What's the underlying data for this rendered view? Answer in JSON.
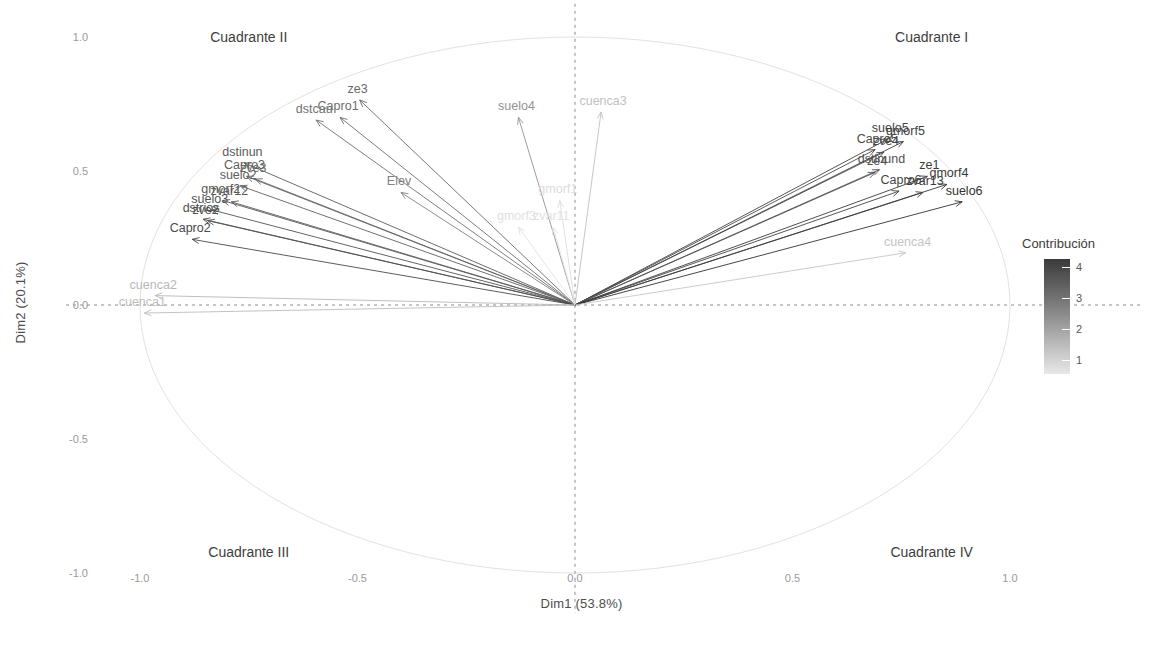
{
  "chart_data": {
    "type": "scatter",
    "subtype": "pca-variable-correlation-biplot",
    "title": "",
    "xlabel": "Dim1 (53.8%)",
    "ylabel": "Dim2 (20.1%)",
    "xlim": [
      -1.15,
      1.15
    ],
    "ylim": [
      -1.15,
      1.15
    ],
    "xticks": [
      "-1.0",
      "-0.5",
      "0.0",
      "0.5",
      "1.0"
    ],
    "xtick_values": [
      -1.0,
      -0.5,
      0.0,
      0.5,
      1.0
    ],
    "yticks": [
      "-1.0",
      "-0.5",
      "0.0",
      "0.5",
      "1.0"
    ],
    "ytick_values": [
      -1.0,
      -0.5,
      0.0,
      0.5,
      1.0
    ],
    "grid": false,
    "reference_circle": true,
    "reference_lines": [
      "x=0 dashed",
      "y=0 dashed"
    ],
    "legend": {
      "title": "Contribución",
      "position": "right",
      "type": "continuous-colorbar",
      "ticks": [
        "4",
        "3",
        "2",
        "1"
      ],
      "tick_values": [
        4,
        3,
        2,
        1
      ],
      "low_color": "#e8e8e8",
      "high_color": "#3a3a3a"
    },
    "annotations": [
      {
        "text": "Cuadrante I",
        "x": 0.82,
        "y": 1.0
      },
      {
        "text": "Cuadrante II",
        "x": -0.75,
        "y": 1.0
      },
      {
        "text": "Cuadrante III",
        "x": -0.75,
        "y": -0.92
      },
      {
        "text": "Cuadrante IV",
        "x": 0.82,
        "y": -0.92
      }
    ],
    "variables": [
      {
        "label": "ze3",
        "x": -0.495,
        "y": 0.765,
        "contrib": 3.1
      },
      {
        "label": "Capro1",
        "x": -0.54,
        "y": 0.7,
        "contrib": 3.0
      },
      {
        "label": "dstcau",
        "x": -0.595,
        "y": 0.69,
        "contrib": 2.9
      },
      {
        "label": "dstinun",
        "x": -0.76,
        "y": 0.53,
        "contrib": 3.4
      },
      {
        "label": "Capro3",
        "x": -0.755,
        "y": 0.48,
        "contrib": 3.3
      },
      {
        "label": "zve3",
        "x": -0.735,
        "y": 0.47,
        "contrib": 3.2
      },
      {
        "label": "suelo2",
        "x": -0.77,
        "y": 0.445,
        "contrib": 3.3
      },
      {
        "label": "gmorf2",
        "x": -0.81,
        "y": 0.39,
        "contrib": 3.5
      },
      {
        "label": "zvar12",
        "x": -0.79,
        "y": 0.385,
        "contrib": 3.4
      },
      {
        "label": "suelo3",
        "x": -0.835,
        "y": 0.355,
        "contrib": 3.6
      },
      {
        "label": "dstrios",
        "x": -0.855,
        "y": 0.32,
        "contrib": 3.7
      },
      {
        "label": "zve2",
        "x": -0.845,
        "y": 0.315,
        "contrib": 3.6
      },
      {
        "label": "Capro2",
        "x": -0.88,
        "y": 0.245,
        "contrib": 3.8
      },
      {
        "label": "cuenca2",
        "x": -0.965,
        "y": 0.035,
        "contrib": 1.4
      },
      {
        "label": "cuenca1",
        "x": -0.99,
        "y": -0.03,
        "contrib": 1.3
      },
      {
        "label": "Elev",
        "x": -0.4,
        "y": 0.42,
        "contrib": 2.6
      },
      {
        "label": "suelo4",
        "x": -0.13,
        "y": 0.7,
        "contrib": 2.2
      },
      {
        "label": "cuenca3",
        "x": 0.06,
        "y": 0.72,
        "contrib": 1.2
      },
      {
        "label": "gmorf1",
        "x": -0.035,
        "y": 0.39,
        "contrib": 0.6
      },
      {
        "label": "gmorf3",
        "x": -0.13,
        "y": 0.29,
        "contrib": 0.5
      },
      {
        "label": "zvar11",
        "x": -0.05,
        "y": 0.29,
        "contrib": 0.5
      },
      {
        "label": "suelo5",
        "x": 0.72,
        "y": 0.62,
        "contrib": 3.9
      },
      {
        "label": "gmorf5",
        "x": 0.755,
        "y": 0.61,
        "contrib": 4.0
      },
      {
        "label": "Capro5",
        "x": 0.69,
        "y": 0.58,
        "contrib": 3.8
      },
      {
        "label": "zve4",
        "x": 0.71,
        "y": 0.57,
        "contrib": 3.8
      },
      {
        "label": "dstinund",
        "x": 0.7,
        "y": 0.505,
        "contrib": 3.6
      },
      {
        "label": "ze4",
        "x": 0.69,
        "y": 0.495,
        "contrib": 3.6
      },
      {
        "label": "ze1",
        "x": 0.81,
        "y": 0.48,
        "contrib": 4.1
      },
      {
        "label": "gmorf4",
        "x": 0.855,
        "y": 0.45,
        "contrib": 4.2
      },
      {
        "label": "Capro6",
        "x": 0.745,
        "y": 0.425,
        "contrib": 3.9
      },
      {
        "label": "zvar13",
        "x": 0.8,
        "y": 0.42,
        "contrib": 4.0
      },
      {
        "label": "suelo6",
        "x": 0.89,
        "y": 0.385,
        "contrib": 4.3
      },
      {
        "label": "cuenca4",
        "x": 0.76,
        "y": 0.195,
        "contrib": 1.1
      }
    ]
  },
  "axes": {
    "xlabel": "Dim1 (53.8%)",
    "ylabel": "Dim2 (20.1%)"
  },
  "legend": {
    "title": "Contribución"
  },
  "quadrants": {
    "q1": "Cuadrante I",
    "q2": "Cuadrante II",
    "q3": "Cuadrante III",
    "q4": "Cuadrante IV"
  }
}
